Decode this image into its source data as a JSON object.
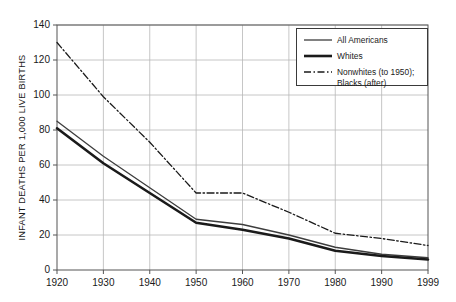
{
  "chart_data": {
    "type": "line",
    "title": "",
    "xlabel": "",
    "ylabel": "INFANT DEATHS PER 1,000 LIVE BIRTHS",
    "x": [
      1920,
      1930,
      1940,
      1950,
      1960,
      1970,
      1980,
      1990,
      1999
    ],
    "xtick_labels": [
      "1920",
      "1930",
      "1940",
      "1950",
      "1960",
      "1970",
      "1980",
      "1990",
      "1999"
    ],
    "ytick_labels": [
      "0",
      "20",
      "40",
      "60",
      "80",
      "100",
      "120",
      "140"
    ],
    "yticks": [
      0,
      20,
      40,
      60,
      80,
      100,
      120,
      140
    ],
    "xlim": [
      1920,
      1999
    ],
    "ylim": [
      0,
      140
    ],
    "grid": true,
    "legend_position": "upper-right",
    "series": [
      {
        "name": "All Americans",
        "style": "solid-thin",
        "color": "#3d3d3d",
        "values": [
          85,
          65,
          47,
          29,
          26,
          20,
          13,
          9,
          7
        ]
      },
      {
        "name": "Whites",
        "style": "solid-thick",
        "color": "#1a1a1a",
        "values": [
          81,
          61,
          44,
          27,
          23,
          18,
          11,
          8,
          6
        ]
      },
      {
        "name": "Nonwhites (to 1950); Blacks (after)",
        "style": "dash-dot",
        "color": "#1a1a1a",
        "values": [
          130,
          99,
          73,
          44,
          44,
          33,
          21,
          18,
          14
        ]
      }
    ]
  },
  "legend": {
    "entries": [
      {
        "label": "All Americans",
        "label2": ""
      },
      {
        "label": "Whites",
        "label2": ""
      },
      {
        "label": "Nonwhites (to 1950);",
        "label2": "Blacks (after)"
      }
    ]
  },
  "axes": {
    "y_title": "INFANT DEATHS PER 1,000 LIVE BIRTHS"
  }
}
